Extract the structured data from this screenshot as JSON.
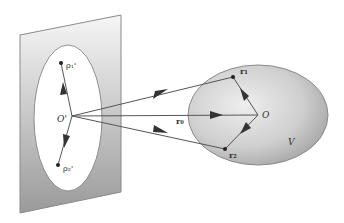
{
  "diagram": {
    "labels": {
      "plane_origin": "O'",
      "rho1": "ρ₁'",
      "rho2": "ρ₂'",
      "r0": "r₀",
      "r1": "r₁",
      "r2": "r₂",
      "volume_origin": "O",
      "volume": "V"
    },
    "colors": {
      "plane_fill_top": "#f4f4f4",
      "plane_fill_bottom": "#9a9a9a",
      "plane_edge": "#888888",
      "volume_fill_light": "#e8e8e8",
      "volume_fill_dark": "#a8a8a8",
      "line": "#555555",
      "arrow": "#333333"
    }
  }
}
